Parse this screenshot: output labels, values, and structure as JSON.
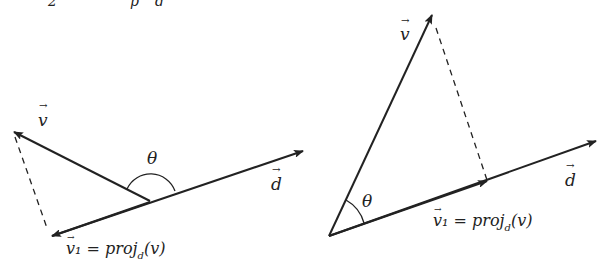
{
  "top_fragment": "2        proj_d",
  "left": {
    "v_label": "v",
    "d_label": "d",
    "theta_label": "θ",
    "v1_label": "v₁ = proj",
    "v1_sub": "d",
    "v1_tail": "(v)"
  },
  "right": {
    "v_label": "v",
    "d_label": "d",
    "theta_label": "θ",
    "v1_label": "v₁ = proj",
    "v1_sub": "d",
    "v1_tail": "(v)"
  }
}
